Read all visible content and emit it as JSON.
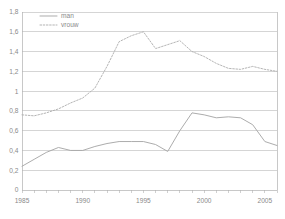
{
  "chart_data": {
    "type": "line",
    "title": "",
    "subtitle": "",
    "xlabel": "",
    "ylabel": "",
    "xlim": [
      1985,
      2006
    ],
    "ylim": [
      0,
      1.8
    ],
    "grid": true,
    "legend_position": "top-left",
    "decimal_separator": ",",
    "y_ticks": [
      0,
      0.2,
      0.4,
      0.6,
      0.8,
      1.0,
      1.2,
      1.4,
      1.6,
      1.8
    ],
    "y_tick_labels": [
      "0",
      "0,2",
      "0,4",
      "0,6",
      "0,8",
      "1",
      "1,2",
      "1,4",
      "1,6",
      "1,8"
    ],
    "x_ticks": [
      1985,
      1986,
      1987,
      1988,
      1989,
      1990,
      1991,
      1992,
      1993,
      1994,
      1995,
      1996,
      1997,
      1998,
      1999,
      2000,
      2001,
      2002,
      2003,
      2004,
      2005,
      2006
    ],
    "x_tick_labels": [
      "1985",
      "",
      "",
      "",
      "",
      "1990",
      "",
      "",
      "",
      "",
      "1995",
      "",
      "",
      "",
      "",
      "2000",
      "",
      "",
      "",
      "",
      "2005",
      ""
    ],
    "x_labeled_ticks": [
      {
        "x": 1985,
        "label": "1985"
      },
      {
        "x": 1990,
        "label": "1990"
      },
      {
        "x": 1995,
        "label": "1995"
      },
      {
        "x": 2000,
        "label": "2000"
      },
      {
        "x": 2005,
        "label": "2005"
      }
    ],
    "x": [
      1985,
      1986,
      1987,
      1988,
      1989,
      1990,
      1991,
      1992,
      1993,
      1994,
      1995,
      1996,
      1997,
      1998,
      1999,
      2000,
      2001,
      2002,
      2003,
      2004,
      2005,
      2006
    ],
    "series": [
      {
        "name": "man",
        "style": "solid",
        "color": "#a8a8a8",
        "values": [
          0.24,
          0.31,
          0.38,
          0.43,
          0.4,
          0.4,
          0.44,
          0.47,
          0.49,
          0.49,
          0.49,
          0.46,
          0.39,
          0.6,
          0.78,
          0.76,
          0.73,
          0.74,
          0.73,
          0.66,
          0.49,
          0.45
        ]
      },
      {
        "name": "vrouw",
        "style": "dotted",
        "color": "#b0b0b0",
        "values": [
          0.76,
          0.75,
          0.78,
          0.82,
          0.88,
          0.93,
          1.03,
          1.25,
          1.5,
          1.56,
          1.6,
          1.43,
          1.47,
          1.51,
          1.4,
          1.35,
          1.28,
          1.23,
          1.22,
          1.25,
          1.22,
          1.2
        ]
      }
    ],
    "legend": [
      {
        "label": "man",
        "style": "solid",
        "color": "#a8a8a8"
      },
      {
        "label": "vrouw",
        "style": "dotted",
        "color": "#b0b0b0"
      }
    ],
    "colors": {
      "background": "#ffffff",
      "gridline": "#b9b9b9",
      "axis": "#b0b0b0",
      "tick_text": "#8a8a8a",
      "man": "#a8a8a8",
      "vrouw": "#b0b0b0"
    }
  },
  "plot_geometry": {
    "left": 22,
    "right": 277,
    "top": 12,
    "bottom": 190
  }
}
